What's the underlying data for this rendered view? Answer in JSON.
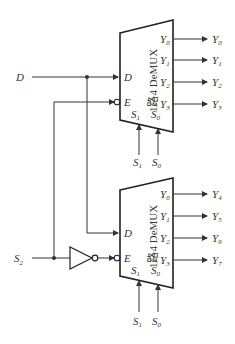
{
  "diagram": {
    "inputs": {
      "data": "D",
      "select_high": "S",
      "select_high_sub": "2"
    },
    "demux_top": {
      "name": "1路4 DeMUX",
      "pins": {
        "data": "D",
        "enable": "E",
        "s1": "S",
        "s1_sub": "1",
        "s0": "S",
        "s0_sub": "0"
      },
      "outputs_internal": [
        {
          "label": "Y",
          "sub": "0"
        },
        {
          "label": "Y",
          "sub": "1"
        },
        {
          "label": "Y",
          "sub": "2"
        },
        {
          "label": "Y",
          "sub": "3"
        }
      ],
      "outputs_external": [
        {
          "label": "Y",
          "sub": "0"
        },
        {
          "label": "Y",
          "sub": "1"
        },
        {
          "label": "Y",
          "sub": "2"
        },
        {
          "label": "Y",
          "sub": "3"
        }
      ],
      "select_inputs": [
        {
          "label": "S",
          "sub": "1"
        },
        {
          "label": "S",
          "sub": "0"
        }
      ]
    },
    "demux_bottom": {
      "name": "1路4 DeMUX",
      "pins": {
        "data": "D",
        "enable": "E",
        "s1": "S",
        "s1_sub": "1",
        "s0": "S",
        "s0_sub": "0"
      },
      "outputs_internal": [
        {
          "label": "Y",
          "sub": "0"
        },
        {
          "label": "Y",
          "sub": "1"
        },
        {
          "label": "Y",
          "sub": "2"
        },
        {
          "label": "Y",
          "sub": "3"
        }
      ],
      "outputs_external": [
        {
          "label": "Y",
          "sub": "4"
        },
        {
          "label": "Y",
          "sub": "5"
        },
        {
          "label": "Y",
          "sub": "6"
        },
        {
          "label": "Y",
          "sub": "7"
        }
      ],
      "select_inputs": [
        {
          "label": "S",
          "sub": "1"
        },
        {
          "label": "S",
          "sub": "0"
        }
      ]
    },
    "gates": [
      {
        "type": "inverter",
        "name": "NOT"
      }
    ]
  }
}
